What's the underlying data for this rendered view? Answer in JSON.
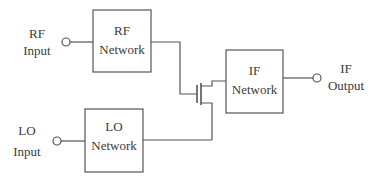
{
  "diagram": {
    "colors": {
      "line": "#555555",
      "text": "#3a3a3a",
      "background": "#ffffff"
    },
    "ports": {
      "rf_input": {
        "line1": "RF",
        "line2": "Input"
      },
      "lo_input": {
        "line1": "LO",
        "line2": "Input"
      },
      "if_output": {
        "line1": "IF",
        "line2": "Output"
      }
    },
    "blocks": {
      "rf_network": {
        "line1": "RF",
        "line2": "Network"
      },
      "lo_network": {
        "line1": "LO",
        "line2": "Network"
      },
      "if_network": {
        "line1": "IF",
        "line2": "Network"
      }
    },
    "components": {
      "transistor": "fet-icon"
    }
  }
}
